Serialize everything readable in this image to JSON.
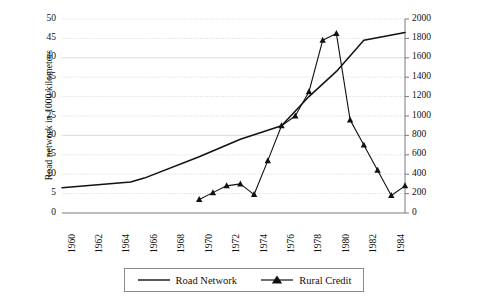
{
  "chart_data": {
    "type": "line",
    "title": "",
    "xlabel": "",
    "x": [
      1960,
      1961,
      1962,
      1963,
      1964,
      1965,
      1966,
      1967,
      1968,
      1969,
      1970,
      1971,
      1972,
      1973,
      1974,
      1975,
      1976,
      1977,
      1978,
      1979,
      1980,
      1981,
      1982,
      1983,
      1984,
      1985
    ],
    "xtick_labels": [
      "1960",
      "1962",
      "1964",
      "1966",
      "1968",
      "1970",
      "1972",
      "1974",
      "1976",
      "1978",
      "1980",
      "1982",
      "1984"
    ],
    "xlim": [
      1960,
      1985
    ],
    "grid": true,
    "legend_position": "bottom",
    "axes": {
      "left": {
        "label": "Road network in 1000 kilometers",
        "ylim": [
          0,
          50
        ],
        "ticks": [
          0,
          5,
          10,
          15,
          20,
          25,
          30,
          35,
          40,
          45,
          50
        ]
      },
      "right": {
        "label": "Rural Credit (million cruzados of 1988)",
        "ylim": [
          0,
          2000
        ],
        "ticks": [
          0,
          200,
          400,
          600,
          800,
          1000,
          1200,
          1400,
          1600,
          1800,
          2000
        ]
      }
    },
    "series": [
      {
        "name": "Road Network",
        "axis": "left",
        "marker": "none",
        "color": "#111111",
        "x": [
          1960,
          1965,
          1966,
          1970,
          1973,
          1976,
          1978,
          1980,
          1982,
          1985
        ],
        "values": [
          6.5,
          8.0,
          9.0,
          14.5,
          19.0,
          22.5,
          30.0,
          36.5,
          44.5,
          46.5
        ]
      },
      {
        "name": "Rural Credit",
        "axis": "right",
        "marker": "triangle",
        "color": "#111111",
        "x": [
          1970,
          1971,
          1972,
          1973,
          1974,
          1975,
          1976,
          1977,
          1978,
          1979,
          1980,
          1981,
          1982,
          1983,
          1984,
          1985
        ],
        "values": [
          140,
          210,
          280,
          300,
          190,
          540,
          900,
          1000,
          1250,
          1780,
          1850,
          960,
          700,
          440,
          180,
          280
        ]
      }
    ]
  },
  "legend": {
    "items": [
      {
        "label": "Road Network",
        "marker": "line"
      },
      {
        "label": "Rural Credit",
        "marker": "line-triangle"
      }
    ]
  }
}
